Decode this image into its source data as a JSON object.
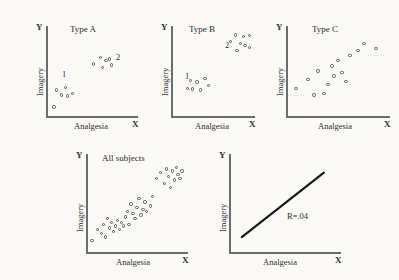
{
  "figure": {
    "background_color": "#fbfaf7",
    "axis_color": "#6d6d6d",
    "point_color": "#555555",
    "line_color": "#1a1a1a"
  },
  "common": {
    "x_label": "Analgesia",
    "y_label": "Imagery",
    "x_tip": "X",
    "y_tip": "Y"
  },
  "chart_data": [
    {
      "type": "scatter",
      "title": "Type A",
      "xlabel": "Analgesia",
      "ylabel": "Imagery",
      "xlim": [
        0,
        100
      ],
      "ylim": [
        0,
        100
      ],
      "grid": false,
      "legend": "none",
      "annotations": [
        {
          "text": "1",
          "x": 16,
          "y": 38
        },
        {
          "text": "2",
          "x": 76,
          "y": 64
        }
      ],
      "series": [
        {
          "name": "cluster 1",
          "points": [
            [
              10,
              28
            ],
            [
              20,
              31
            ],
            [
              15,
              22
            ],
            [
              22,
              21
            ],
            [
              28,
              24
            ],
            [
              7,
              8
            ]
          ]
        },
        {
          "name": "cluster 2",
          "points": [
            [
              52,
              58
            ],
            [
              60,
              66
            ],
            [
              66,
              62
            ],
            [
              70,
              64
            ],
            [
              62,
              54
            ],
            [
              72,
              57
            ]
          ]
        }
      ]
    },
    {
      "type": "scatter",
      "title": "Type B",
      "xlabel": "Analgesia",
      "ylabel": "Imagery",
      "xlim": [
        0,
        100
      ],
      "ylim": [
        0,
        100
      ],
      "grid": false,
      "legend": "none",
      "annotations": [
        {
          "text": "1",
          "x": 14,
          "y": 40
        },
        {
          "text": "2",
          "x": 66,
          "y": 78
        }
      ],
      "series": [
        {
          "name": "cluster 1",
          "points": [
            [
              22,
              39
            ],
            [
              30,
              37
            ],
            [
              40,
              41
            ],
            [
              24,
              29
            ],
            [
              34,
              28
            ],
            [
              44,
              33
            ],
            [
              18,
              30
            ]
          ]
        },
        {
          "name": "cluster 2",
          "points": [
            [
              78,
              92
            ],
            [
              88,
              90
            ],
            [
              96,
              91
            ],
            [
              72,
              84
            ],
            [
              84,
              82
            ],
            [
              90,
              80
            ],
            [
              96,
              77
            ],
            [
              80,
              74
            ]
          ]
        }
      ]
    },
    {
      "type": "scatter",
      "title": "Type C",
      "xlabel": "Analgesia",
      "ylabel": "Imagery",
      "xlim": [
        0,
        100
      ],
      "ylim": [
        0,
        100
      ],
      "grid": false,
      "legend": "none",
      "annotations": [],
      "series": [
        {
          "name": "subjects",
          "points": [
            [
              8,
              30
            ],
            [
              20,
              40
            ],
            [
              30,
              50
            ],
            [
              44,
              56
            ],
            [
              46,
              44
            ],
            [
              50,
              62
            ],
            [
              54,
              48
            ],
            [
              58,
              38
            ],
            [
              62,
              68
            ],
            [
              70,
              74
            ],
            [
              76,
              82
            ],
            [
              88,
              76
            ],
            [
              36,
              24
            ],
            [
              26,
              22
            ],
            [
              40,
              34
            ]
          ]
        }
      ]
    },
    {
      "type": "scatter",
      "title": "All subjects",
      "xlabel": "Analgesia",
      "ylabel": "Imagery",
      "xlim": [
        0,
        100
      ],
      "ylim": [
        0,
        100
      ],
      "grid": false,
      "legend": "none",
      "annotations": [],
      "series": [
        {
          "name": "all subjects",
          "points": [
            [
              4,
              10
            ],
            [
              10,
              22
            ],
            [
              14,
              18
            ],
            [
              16,
              28
            ],
            [
              18,
              14
            ],
            [
              20,
              34
            ],
            [
              22,
              24
            ],
            [
              24,
              30
            ],
            [
              26,
              20
            ],
            [
              28,
              26
            ],
            [
              30,
              32
            ],
            [
              32,
              22
            ],
            [
              34,
              30
            ],
            [
              36,
              26
            ],
            [
              38,
              36
            ],
            [
              40,
              42
            ],
            [
              42,
              28
            ],
            [
              44,
              50
            ],
            [
              46,
              40
            ],
            [
              48,
              34
            ],
            [
              50,
              46
            ],
            [
              52,
              56
            ],
            [
              54,
              38
            ],
            [
              56,
              44
            ],
            [
              58,
              52
            ],
            [
              60,
              42
            ],
            [
              64,
              48
            ],
            [
              66,
              58
            ],
            [
              70,
              78
            ],
            [
              74,
              84
            ],
            [
              78,
              72
            ],
            [
              80,
              88
            ],
            [
              82,
              80
            ],
            [
              86,
              86
            ],
            [
              88,
              76
            ],
            [
              90,
              90
            ],
            [
              92,
              82
            ],
            [
              94,
              78
            ],
            [
              96,
              86
            ],
            [
              84,
              68
            ]
          ]
        }
      ]
    },
    {
      "type": "line",
      "title": "",
      "xlabel": "Analgesia",
      "ylabel": "Imagery",
      "xlim": [
        0,
        100
      ],
      "ylim": [
        0,
        100
      ],
      "grid": false,
      "legend": "none",
      "annotations": [
        {
          "text": "R=.04",
          "x": 56,
          "y": 30
        }
      ],
      "series": [
        {
          "name": "regression line",
          "points": [
            [
              10,
              14
            ],
            [
              86,
              84
            ]
          ]
        }
      ]
    }
  ],
  "panels": {
    "type_a": {
      "title": "Type A",
      "label_1": "1",
      "label_2": "2"
    },
    "type_b": {
      "title": "Type B",
      "label_1": "1",
      "label_2": "2"
    },
    "type_c": {
      "title": "Type C"
    },
    "all_subjects": {
      "title": "All subjects"
    },
    "regression": {
      "r_label": "R=.04"
    }
  }
}
